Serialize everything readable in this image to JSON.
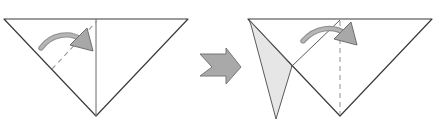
{
  "figure": {
    "type": "instruction-diagram",
    "width": 448,
    "height": 129,
    "background_color": "#ffffff",
    "stroke_color": "#3b3b3b",
    "crease_color": "#8c8c8c",
    "arrow_fill": "#a8a8a8",
    "arrow_stroke": "#6e6e6e",
    "flap_fill": "#e4e4e4",
    "paper_fill": "#ffffff"
  },
  "panels": [
    {
      "id": "panel-before",
      "label": "Step before fold",
      "shape": {
        "name": "inverted-triangle",
        "points": "4,19 188,19 96,116"
      },
      "center_crease": {
        "name": "vertical-center-crease",
        "x1": 96,
        "y1": 19,
        "x2": 96,
        "y2": 116,
        "style": "solid"
      },
      "fold_line": {
        "name": "diagonal-fold-line",
        "x1": 52,
        "y1": 69,
        "x2": 97,
        "y2": 21,
        "style": "dashed"
      },
      "arrow": {
        "name": "fold-direction-arrow",
        "direction": "right-down",
        "path": "M 41,48 C 51,34 70,30 83,40",
        "head": "84,30 92,48 72,48"
      }
    },
    {
      "id": "panel-after",
      "label": "Step after fold",
      "shape": {
        "name": "inverted-triangle",
        "points": "248,19 432,19 340,116"
      },
      "flap": {
        "name": "folded-flap",
        "points": "249,20 292,66 276,119 251,25"
      },
      "crease_solid": {
        "name": "flap-crease-line",
        "x1": 340,
        "y1": 20,
        "x2": 291,
        "y2": 67,
        "style": "solid"
      },
      "center_crease": {
        "name": "vertical-center-crease",
        "x1": 340,
        "y1": 20,
        "x2": 340,
        "y2": 114,
        "style": "dashed"
      },
      "arrow": {
        "name": "fold-direction-arrow",
        "direction": "right-down",
        "path": "M 303,41 C 315,26 334,24 347,34",
        "head": "348,24 356,42 336,42"
      }
    }
  ],
  "connector": {
    "name": "step-arrow",
    "label": "next step",
    "shape_points": "200,54 226,54 226,48 241,67 226,84 226,76 200,76 212,67",
    "fill": "#a9a9a9",
    "stroke": "#777777"
  }
}
